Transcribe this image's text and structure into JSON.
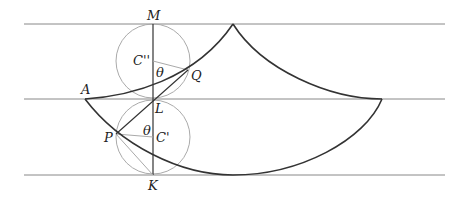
{
  "diagram": {
    "type": "cycloid-construction",
    "labels": {
      "M": "M",
      "C2": "C''",
      "theta_upper": "θ",
      "Q": "Q",
      "A": "A",
      "L": "L",
      "P": "P",
      "theta_lower": "θ",
      "C1": "C'",
      "K": "K"
    },
    "colors": {
      "curve": "#333333",
      "guide_lines": "#888888",
      "circles": "#aaaaaa"
    }
  }
}
